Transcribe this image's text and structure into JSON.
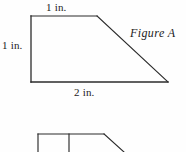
{
  "document": {
    "type": "geometry-worksheet-figure",
    "background_color": "#fefefe",
    "stroke_color": "#2b2b2b"
  },
  "figure_a": {
    "name": "Figure A",
    "shape": "right trapezoid",
    "labels": {
      "top_side": "1 in.",
      "left_side": "1 in.",
      "bottom_side": "2 in."
    },
    "vertices": {
      "top_left": [
        31,
        16
      ],
      "top_right": [
        97,
        16
      ],
      "bottom_right": [
        168,
        82
      ],
      "bottom_left": [
        31,
        82
      ]
    }
  },
  "figure_b_partial": {
    "description": "partially visible second figure cut off at bottom edge",
    "top_edge": [
      [
        38,
        134
      ],
      [
        104,
        134
      ]
    ],
    "left_edge": [
      [
        38,
        134
      ],
      [
        38,
        152
      ]
    ],
    "middle_divider": [
      [
        69,
        134
      ],
      [
        69,
        152
      ]
    ],
    "diagonal_edge": [
      [
        104,
        134
      ],
      [
        124,
        152
      ]
    ]
  }
}
